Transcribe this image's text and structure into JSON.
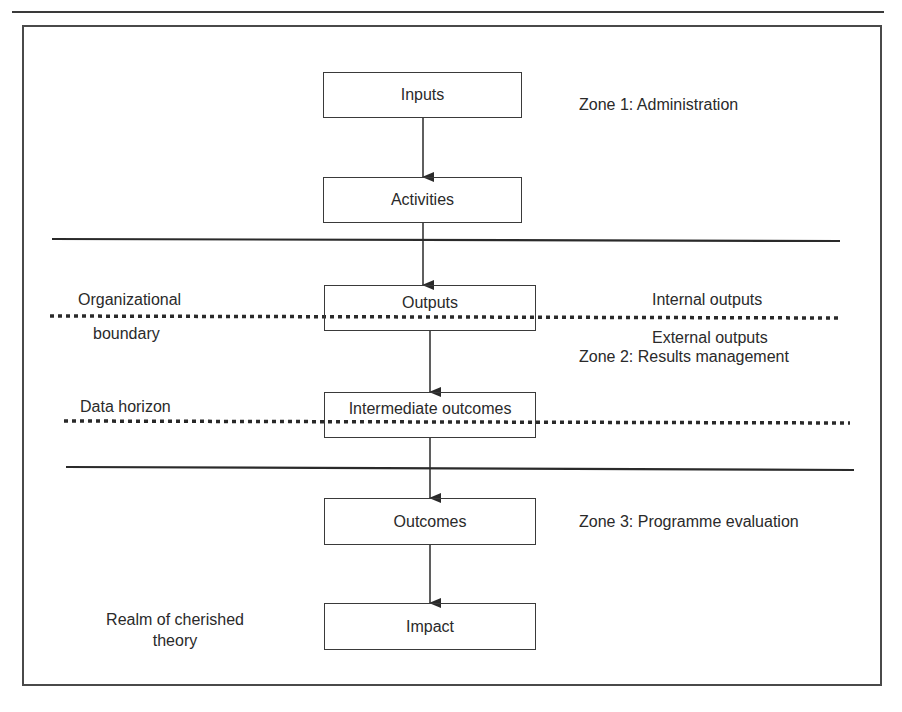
{
  "diagram": {
    "boxes": [
      {
        "id": "inputs",
        "label": "Inputs"
      },
      {
        "id": "activities",
        "label": "Activities"
      },
      {
        "id": "outputs",
        "label": "Outputs"
      },
      {
        "id": "intermediate_outcomes",
        "label": "Intermediate outcomes"
      },
      {
        "id": "outcomes",
        "label": "Outcomes"
      },
      {
        "id": "impact",
        "label": "Impact"
      }
    ],
    "zones": {
      "zone1": "Zone 1: Administration",
      "zone2": "Zone 2: Results management",
      "zone3": "Zone 3: Programme evaluation"
    },
    "left_labels": {
      "organizational_line1": "Organizational",
      "organizational_line2": "boundary",
      "data_horizon": "Data horizon",
      "cherished_line1": "Realm of cherished",
      "cherished_line2": "theory"
    },
    "right_labels": {
      "internal_outputs": "Internal outputs",
      "external_outputs": "External outputs"
    },
    "colors": {
      "stroke": "#3a3a3a",
      "text": "#2a2a2a",
      "background": "#ffffff"
    }
  }
}
